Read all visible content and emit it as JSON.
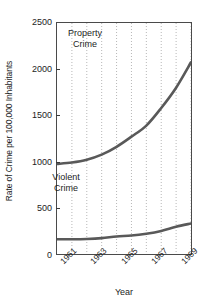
{
  "chart_data": {
    "type": "line",
    "title": "",
    "xlabel": "Year",
    "ylabel": "Rate of Crime per 100,000 Inhabitants",
    "xlim": [
      1960,
      1969
    ],
    "ylim": [
      0,
      2500
    ],
    "yticks": [
      0,
      500,
      1000,
      1500,
      2000,
      2500
    ],
    "ytick_labels": [
      "0",
      "500",
      "1000",
      "1500",
      "2000",
      "2500"
    ],
    "xticks": [
      1961,
      1963,
      1965,
      1967,
      1969
    ],
    "xtick_labels": [
      "1961",
      "1963",
      "1965",
      "1967",
      "1969"
    ],
    "x": [
      1960,
      1961,
      1962,
      1963,
      1964,
      1965,
      1966,
      1967,
      1968,
      1969
    ],
    "grid": "vertical-dotted",
    "legend": "inline-annotations",
    "line_color": "#595959",
    "series": [
      {
        "name": "Property Crime",
        "label": "Property\nCrime",
        "values": [
          975,
          990,
          1020,
          1075,
          1160,
          1270,
          1390,
          1580,
          1800,
          2075
        ]
      },
      {
        "name": "Violent Crime",
        "label": "Violent\nCrime",
        "values": [
          160,
          160,
          163,
          172,
          190,
          200,
          220,
          250,
          295,
          330
        ]
      }
    ]
  },
  "axis": {
    "ylabel_text": "Rate of Crime per 100,000 Inhabitants",
    "xlabel_text": "Year"
  }
}
